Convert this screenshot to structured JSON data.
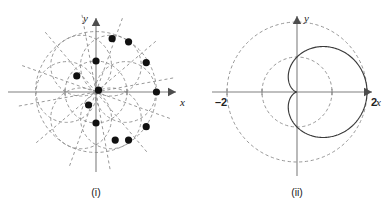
{
  "figure": {
    "background_color": "#ffffff",
    "width": 391,
    "height": 205,
    "axis_color": "#808080",
    "dashed_color": "#8c8c8c",
    "solid_color": "#3a3a3a",
    "dot_color": "#111111"
  },
  "panels": [
    {
      "id": "i",
      "caption": "(i)",
      "x_axis_label": "x",
      "y_axis_label": "y",
      "tick_labels": [],
      "chart_data": {
        "type": "scatter",
        "title": "",
        "xlabel": "x",
        "ylabel": "y",
        "xlim": [
          -2.6,
          2.6
        ],
        "ylim": [
          -2.6,
          2.6
        ],
        "grid": false,
        "legend": "none",
        "description": "Complex roots plotted on concentric dashed circles with dashed radial rays from the origin",
        "dashed_circles_radii": [
          1.0,
          1.95
        ],
        "dashed_ray_count": 12,
        "points": [
          {
            "x": 1.95,
            "y": 0.0
          },
          {
            "x": 1.62,
            "y": 0.95
          },
          {
            "x": 1.05,
            "y": 1.62
          },
          {
            "x": 0.52,
            "y": 1.72
          },
          {
            "x": 0.0,
            "y": 1.0
          },
          {
            "x": -0.62,
            "y": 0.52
          },
          {
            "x": -0.24,
            "y": -0.42
          },
          {
            "x": 0.0,
            "y": -1.0
          },
          {
            "x": 0.62,
            "y": -1.55
          },
          {
            "x": 1.05,
            "y": -1.55
          },
          {
            "x": 1.62,
            "y": -1.12
          },
          {
            "x": 0.08,
            "y": 0.06
          }
        ]
      }
    },
    {
      "id": "ii",
      "caption": "(ii)",
      "x_axis_label": "x",
      "y_axis_label": "y",
      "tick_labels": [
        {
          "text": "-2",
          "x": -2
        },
        {
          "text": "2",
          "x": 2
        }
      ],
      "chart_data": {
        "type": "line",
        "title": "",
        "xlabel": "x",
        "ylabel": "y",
        "xlim": [
          -2.6,
          2.6
        ],
        "ylim": [
          -2.6,
          2.6
        ],
        "grid": false,
        "legend": "none",
        "description": "Cardioid r = 1 + cos(theta) scaled to pass through x = 2, shown solid, with dashed reference circles of radius 1 and 2 centred at the origin",
        "dashed_circles_radii": [
          1.0,
          2.0
        ],
        "solid_curve": {
          "name": "cardioid",
          "equation": "r = 1 + cos(theta)",
          "max_x": 2,
          "cusp_at_origin": true
        }
      }
    }
  ]
}
